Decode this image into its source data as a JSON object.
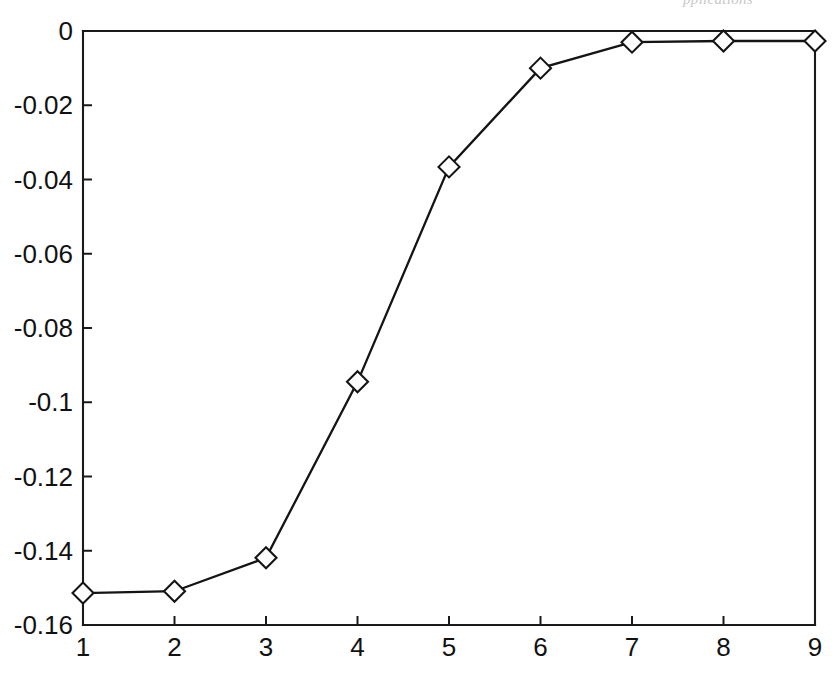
{
  "page": {
    "running_header": "pplications",
    "background_color": "#ffffff",
    "ink_color": "#141414"
  },
  "chart_data": {
    "type": "line",
    "title": "",
    "subtitle": "",
    "xlabel": "",
    "ylabel": "",
    "x": [
      1,
      2,
      3,
      4,
      5,
      6,
      7,
      8,
      9
    ],
    "values": [
      -0.1514,
      -0.1509,
      -0.1419,
      -0.0945,
      -0.0366,
      -0.01,
      -0.003,
      -0.0027,
      -0.0027
    ],
    "series": [
      {
        "name": "series-1",
        "marker": "diamond",
        "line_style": "solid",
        "color": "#141414",
        "values": [
          -0.1514,
          -0.1509,
          -0.1419,
          -0.0945,
          -0.0366,
          -0.01,
          -0.003,
          -0.0027,
          -0.0027
        ]
      }
    ],
    "xlim": [
      1,
      9
    ],
    "ylim": [
      -0.16,
      0
    ],
    "xticks": [
      1,
      2,
      3,
      4,
      5,
      6,
      7,
      8,
      9
    ],
    "yticks": [
      0,
      -0.02,
      -0.04,
      -0.06,
      -0.08,
      -0.1,
      -0.12,
      -0.14,
      -0.16
    ],
    "xtick_labels": [
      "1",
      "2",
      "3",
      "4",
      "5",
      "6",
      "7",
      "8",
      "9"
    ],
    "ytick_labels": [
      "0",
      "-0.02",
      "-0.04",
      "-0.06",
      "-0.08",
      "-0.1",
      "-0.12",
      "-0.14",
      "-0.16"
    ],
    "grid": false,
    "legend": null,
    "legend_position": "none",
    "annotations": []
  }
}
